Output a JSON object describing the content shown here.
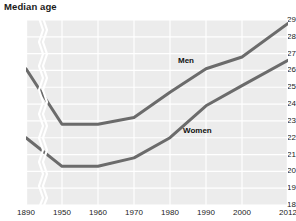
{
  "chart_data": {
    "type": "line",
    "title": "Median age",
    "xlabel": "",
    "ylabel": "",
    "ylim": [
      18,
      29
    ],
    "grid": true,
    "legend_position": "inline-labels",
    "axis_break": {
      "present": true,
      "between": [
        "1890",
        "1950"
      ],
      "style": "zigzag"
    },
    "x_tick_labels": [
      "1890",
      "1950",
      "1960",
      "1970",
      "1980",
      "1990",
      "2000",
      "2012"
    ],
    "y_tick_labels": [
      "29",
      "28",
      "27",
      "26",
      "25",
      "24",
      "23",
      "22",
      "21",
      "20",
      "19",
      "18"
    ],
    "categories": [
      "1890",
      "1950",
      "1960",
      "1970",
      "1980",
      "1990",
      "2000",
      "2012"
    ],
    "series": [
      {
        "name": "Men",
        "color": "#6b6b6b",
        "values": [
          26.1,
          22.8,
          22.8,
          23.2,
          24.7,
          26.1,
          26.8,
          28.8
        ],
        "label_text": "Men"
      },
      {
        "name": "Women",
        "color": "#6b6b6b",
        "values": [
          22.0,
          20.3,
          20.3,
          20.8,
          22.0,
          23.9,
          25.1,
          26.6
        ],
        "label_text": "Women"
      }
    ],
    "colors": {
      "plot_background": "#ececec",
      "gridline": "#ffffff",
      "line": "#6b6b6b",
      "text": "#222222",
      "page_background": "#ffffff"
    }
  }
}
